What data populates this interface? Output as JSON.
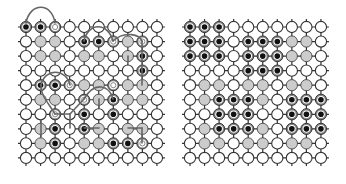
{
  "figure": {
    "legend": {
      "W": "empty node",
      "G": "gray node",
      "B": "black qubit node",
      "T": "ringed target node"
    },
    "colors": {
      "line": "#333333",
      "node_fill": "#ffffff",
      "node_stroke": "#333333",
      "gray": "#cccccc",
      "black": "#111111",
      "ring": "#888888",
      "path": "#666666"
    },
    "grid": {
      "rows": 10,
      "cols": 10,
      "spacing": 14.55,
      "radius": 5.6
    },
    "panels": [
      {
        "id": "left",
        "origin": [
          26,
          27
        ],
        "cells": [
          "BBTWWWWWWW",
          "WGGWBBTGTW",
          "WGGWGGWGBW",
          "WWWWWWWWBW",
          "WBBTGGTGGW",
          "WGGWTGBGGW",
          "WWTWBWBWWW",
          "WGBWBGWGGW",
          "WGBWGGBBTW",
          "WWWWWWWWWW"
        ],
        "paths": [
          "M26,23 C30,2 52,2 55,23",
          "M84,41 C88,22 108,22 113,41",
          "M113,41 C125,30 140,35 142,41",
          "M142,41 L142,70",
          "M41,85 C45,68 66,68 70,85",
          "M128,56 L128,62",
          "M99,99 L99,108",
          "M113,99 C110,86 95,80 84,99",
          "M84,99 L70,114",
          "M70,114 L55,114",
          "M70,114 L70,128",
          "M41,120 L41,137",
          "M84,128 L99,128",
          "M128,128 L142,128",
          "M142,128 L142,143",
          "M142,85 L142,70",
          "M55,114 C50,105 40,95 41,85"
        ]
      },
      {
        "id": "right",
        "origin": [
          190,
          27
        ],
        "cells": [
          "BBBWWWWWWW",
          "BBBWBBBGGW",
          "BBBWBBBGGW",
          "WWWWBBBWWW",
          "WGGWGGWGGW",
          "WGBBBGWBBB",
          "WWBBBWWBBB",
          "WGBBBGWBBB",
          "WGGWGGWGGW",
          "WWWWWWWWWW"
        ],
        "paths": []
      }
    ]
  }
}
